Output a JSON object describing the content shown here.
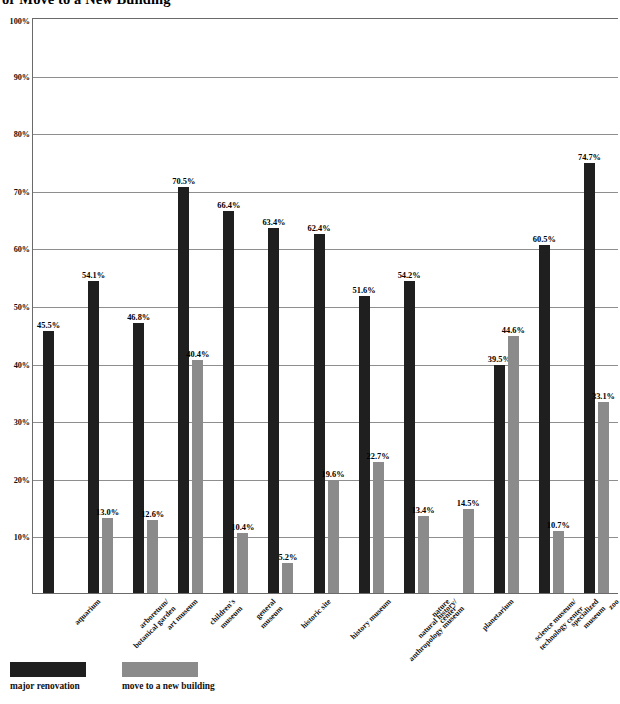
{
  "chart_data": {
    "type": "bar",
    "title": "or Move to a New Building",
    "xlabel": "",
    "ylabel": "",
    "ylim": [
      0,
      100
    ],
    "ytick_labels": [
      "100%",
      "90%",
      "80%",
      "70%",
      "60%",
      "50%",
      "40%",
      "30%",
      "20%",
      "10%"
    ],
    "ytick_values": [
      100,
      90,
      80,
      70,
      60,
      50,
      40,
      30,
      20,
      10
    ],
    "grid": true,
    "legend_position": "bottom-left",
    "value_suffix": "%",
    "categories": [
      "aquarium",
      "arboretum/\nbotanical garden",
      "art museum",
      "children's\nmuseum",
      "general\nmuseum",
      "historic site",
      "history museum",
      "natural history/\nanthropology museum",
      "nature\ncenter",
      "planetarium",
      "science museum/\ntechnology center",
      "specialized\nmuseum",
      "zoo"
    ],
    "series": [
      {
        "name": "major renovation",
        "color": "#1f1f1f",
        "values": [
          45.5,
          54.1,
          46.8,
          70.5,
          66.4,
          63.4,
          62.4,
          51.6,
          54.2,
          null,
          39.5,
          60.5,
          74.7
        ],
        "labels": [
          "45.5%",
          "54.1%",
          "46.8%",
          "70.5%",
          "66.4%",
          "63.4%",
          "62.4%",
          "51.6%",
          "54.2%",
          "",
          "39.5%",
          "60.5%",
          "74.7%"
        ]
      },
      {
        "name": "move to a new building",
        "color": "#8b8b8b",
        "values": [
          null,
          13.0,
          12.6,
          40.4,
          10.4,
          5.2,
          19.6,
          22.7,
          13.4,
          14.5,
          44.6,
          10.7,
          33.1
        ],
        "labels": [
          "",
          "13.0%",
          "12.6%",
          "40.4%",
          "10.4%",
          "5.2%",
          "19.6%",
          "22.7%",
          "13.4%",
          "14.5%",
          "44.6%",
          "10.7%",
          "33.1%"
        ]
      }
    ]
  },
  "legend": {
    "items": [
      {
        "label": "major renovation",
        "color": "#1f1f1f"
      },
      {
        "label": "move to a new building",
        "color": "#8b8b8b"
      }
    ]
  }
}
